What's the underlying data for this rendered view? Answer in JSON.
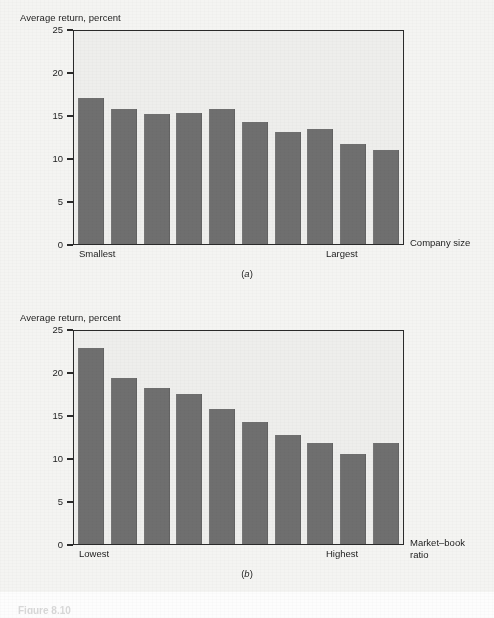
{
  "figure": {
    "caption": "Figure 8.10",
    "background_color": "#f4f4f2",
    "bar_color": "#6f6f6f",
    "plot_background_color": "#eeeeec",
    "axis_color": "#2a2a2a"
  },
  "chart_data": [
    {
      "type": "bar",
      "panel": "(a)",
      "panel_label_text": "a",
      "title": "",
      "ylabel": "Average return, percent",
      "xlabel": "Company size",
      "xlabel_lines": [
        "Company size"
      ],
      "ylim": [
        0,
        25
      ],
      "yticks": [
        0,
        5,
        10,
        15,
        20,
        25
      ],
      "ytick_labels": [
        "0",
        "5",
        "10",
        "15",
        "20",
        "25"
      ],
      "grid": false,
      "legend": "none",
      "x_axis_start_label": "Smallest",
      "x_axis_end_label": "Largest",
      "categories": [
        "1",
        "2",
        "3",
        "4",
        "5",
        "6",
        "7",
        "8",
        "9",
        "10"
      ],
      "values": [
        17.0,
        15.7,
        15.1,
        15.2,
        15.7,
        14.2,
        13.0,
        13.4,
        11.6,
        10.9
      ]
    },
    {
      "type": "bar",
      "panel": "(b)",
      "panel_label_text": "b",
      "title": "",
      "ylabel": "Average return, percent",
      "xlabel": "Market–book ratio",
      "xlabel_lines": [
        "Market–book",
        "ratio"
      ],
      "ylim": [
        0,
        25
      ],
      "yticks": [
        0,
        5,
        10,
        15,
        20,
        25
      ],
      "ytick_labels": [
        "0",
        "5",
        "10",
        "15",
        "20",
        "25"
      ],
      "grid": false,
      "legend": "none",
      "x_axis_start_label": "Lowest",
      "x_axis_end_label": "Highest",
      "categories": [
        "1",
        "2",
        "3",
        "4",
        "5",
        "6",
        "7",
        "8",
        "9",
        "10"
      ],
      "values": [
        22.8,
        19.3,
        18.1,
        17.4,
        15.7,
        14.2,
        12.7,
        11.7,
        10.5,
        11.7
      ]
    }
  ]
}
